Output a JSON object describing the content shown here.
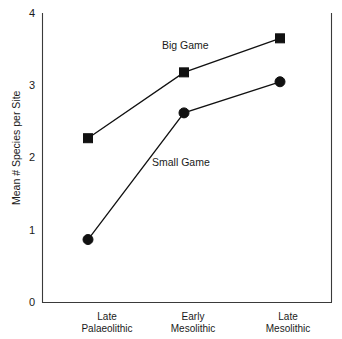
{
  "chart_data": {
    "type": "line",
    "title": "",
    "subtitle": "",
    "xlabel": "",
    "ylabel": "Mean # Species per Site",
    "categories": [
      "Late Palaeolithic",
      "Early Mesolithic",
      "Late Mesolithic"
    ],
    "category_lines": [
      [
        "Late",
        "Palaeolithic"
      ],
      [
        "Early",
        "Mesolithic"
      ],
      [
        "Late",
        "Mesolithic"
      ]
    ],
    "ylim": [
      0,
      4
    ],
    "yticks": [
      0,
      1,
      2,
      3,
      4
    ],
    "ytick_labels": [
      "0",
      "1",
      "2",
      "3",
      "4"
    ],
    "grid": false,
    "legend_position": "inline-annotation",
    "series": [
      {
        "name": "Big Game",
        "marker": "square",
        "color": "#111111",
        "values": [
          2.27,
          3.18,
          3.65
        ]
      },
      {
        "name": "Small Game",
        "marker": "circle",
        "color": "#111111",
        "values": [
          0.87,
          2.62,
          3.05
        ]
      }
    ],
    "annotations": [
      {
        "text": "Big Game",
        "x_px": 162,
        "y_px": 49
      },
      {
        "text": "Small Game",
        "x_px": 152,
        "y_px": 166
      }
    ]
  },
  "colors": {
    "background": "#ffffff",
    "ink": "#111111",
    "axis": "#3a3a3a"
  }
}
